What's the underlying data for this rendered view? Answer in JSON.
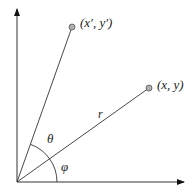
{
  "diagram": {
    "axes": {
      "x_axis": "horizontal axis",
      "y_axis": "vertical axis"
    },
    "points": [
      {
        "id": "original",
        "label": "(x, y)",
        "color": "#b0b0b0"
      },
      {
        "id": "rotated",
        "label": "(x′, y′)",
        "color": "#b0b0b0"
      }
    ],
    "radius_label": "r",
    "angles": [
      {
        "id": "theta",
        "label": "θ",
        "meaning": "rotation angle between r and rotated vector"
      },
      {
        "id": "phi",
        "label": "φ",
        "meaning": "angle between x-axis and r"
      }
    ],
    "colors": {
      "line": "#333333",
      "point_fill": "#b0b0b0",
      "point_stroke": "#555555"
    }
  }
}
